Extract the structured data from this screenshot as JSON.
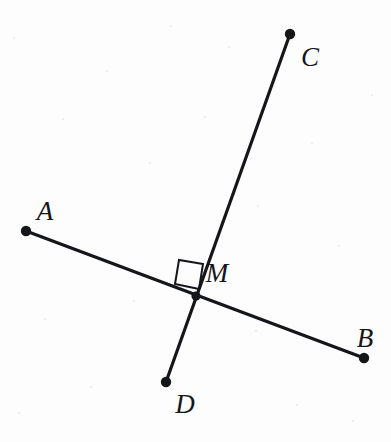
{
  "figure": {
    "kind": "geometry-diagram",
    "width": 391,
    "height": 442,
    "background_color": "#fdfdfd",
    "stroke_color": "#15161a",
    "stroke_width": 3.2,
    "dot_radius": 5.2,
    "right_angle_marker": {
      "present": true,
      "quadrant": "upper-left",
      "stroke_width": 2.0,
      "side_length": 24,
      "corners": [
        {
          "x": 203,
          "y": 264
        },
        {
          "x": 179,
          "y": 260
        },
        {
          "x": 175,
          "y": 284
        },
        {
          "x": 199,
          "y": 289
        }
      ]
    },
    "points": [
      {
        "id": "A",
        "label": "A",
        "x": 26,
        "y": 231,
        "label_x": 45,
        "label_y": 211,
        "endpoint": true
      },
      {
        "id": "B",
        "label": "B",
        "x": 364,
        "y": 358,
        "label_x": 365,
        "label_y": 338,
        "endpoint": true
      },
      {
        "id": "C",
        "label": "C",
        "x": 290,
        "y": 34,
        "label_x": 310,
        "label_y": 57,
        "endpoint": true
      },
      {
        "id": "D",
        "label": "D",
        "x": 166,
        "y": 382,
        "label_x": 185,
        "label_y": 404,
        "endpoint": true
      },
      {
        "id": "M",
        "label": "M",
        "x": 196,
        "y": 296,
        "label_x": 217,
        "label_y": 273,
        "endpoint": false
      }
    ],
    "segments": [
      {
        "id": "AB",
        "from": "A",
        "to": "B",
        "x1": 26,
        "y1": 231,
        "x2": 364,
        "y2": 358
      },
      {
        "id": "CD",
        "from": "C",
        "to": "D",
        "x1": 290,
        "y1": 34,
        "x2": 166,
        "y2": 382
      }
    ],
    "speckles": [
      {
        "x": 13,
        "y": 37
      },
      {
        "x": 62,
        "y": 118
      },
      {
        "x": 106,
        "y": 70
      },
      {
        "x": 149,
        "y": 162
      },
      {
        "x": 204,
        "y": 116
      },
      {
        "x": 257,
        "y": 205
      },
      {
        "x": 311,
        "y": 142
      },
      {
        "x": 338,
        "y": 245
      },
      {
        "x": 371,
        "y": 94
      },
      {
        "x": 44,
        "y": 318
      },
      {
        "x": 90,
        "y": 386
      },
      {
        "x": 133,
        "y": 300
      },
      {
        "x": 255,
        "y": 330
      },
      {
        "x": 296,
        "y": 404
      },
      {
        "x": 352,
        "y": 420
      },
      {
        "x": 18,
        "y": 412
      },
      {
        "x": 228,
        "y": 46
      },
      {
        "x": 170,
        "y": 25
      }
    ]
  }
}
